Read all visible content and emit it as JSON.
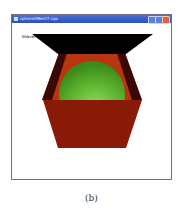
{
  "window": {
    "title": "spherehMesh7.cpp",
    "buttons": {
      "minimize": "minimize",
      "maximize": "maximize",
      "close": "close"
    }
  },
  "canvas": {
    "overlay_text": "Unaveraged normals!",
    "colors": {
      "background": "#ffffff",
      "box_back_face": "#b8360f",
      "box_front_face": "#8a1a08",
      "box_side_dark": "#3a0804",
      "box_lid": "#000000",
      "sphere": "#5cb32e",
      "sphere_highlight": "#e8ffd8"
    }
  },
  "caption": "(b)"
}
